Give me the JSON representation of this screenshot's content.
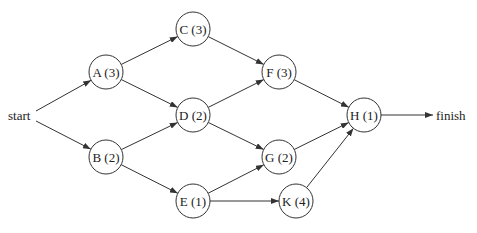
{
  "diagram": {
    "type": "activity-network",
    "colors": {
      "stroke": "#333333",
      "text": "#222222",
      "background": "#ffffff"
    },
    "terminals": {
      "start": {
        "label": "start",
        "x": 8,
        "y": 120
      },
      "finish": {
        "label": "finish",
        "x": 436,
        "y": 120
      }
    },
    "nodes": [
      {
        "id": "A",
        "label": "A (3)",
        "duration": 3,
        "x": 106,
        "y": 72
      },
      {
        "id": "B",
        "label": "B (2)",
        "duration": 2,
        "x": 106,
        "y": 157
      },
      {
        "id": "C",
        "label": "C (3)",
        "duration": 3,
        "x": 193,
        "y": 29
      },
      {
        "id": "D",
        "label": "D (2)",
        "duration": 2,
        "x": 193,
        "y": 115
      },
      {
        "id": "E",
        "label": "E (1)",
        "duration": 1,
        "x": 193,
        "y": 201
      },
      {
        "id": "F",
        "label": "F (3)",
        "duration": 3,
        "x": 279,
        "y": 72
      },
      {
        "id": "G",
        "label": "G (2)",
        "duration": 2,
        "x": 279,
        "y": 157
      },
      {
        "id": "K",
        "label": "K (4)",
        "duration": 4,
        "x": 296,
        "y": 201
      },
      {
        "id": "H",
        "label": "H (1)",
        "duration": 1,
        "x": 364,
        "y": 115
      }
    ],
    "edges": [
      [
        "start",
        "A"
      ],
      [
        "start",
        "B"
      ],
      [
        "A",
        "C"
      ],
      [
        "A",
        "D"
      ],
      [
        "B",
        "D"
      ],
      [
        "B",
        "E"
      ],
      [
        "C",
        "F"
      ],
      [
        "D",
        "F"
      ],
      [
        "D",
        "G"
      ],
      [
        "E",
        "G"
      ],
      [
        "E",
        "K"
      ],
      [
        "F",
        "H"
      ],
      [
        "G",
        "H"
      ],
      [
        "K",
        "H"
      ],
      [
        "H",
        "finish"
      ]
    ]
  }
}
